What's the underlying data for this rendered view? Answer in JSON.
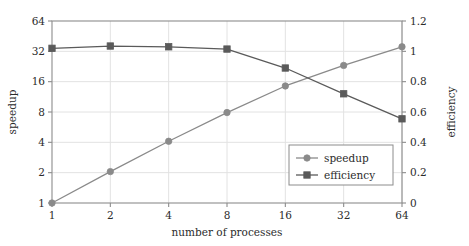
{
  "chart_data": {
    "type": "line",
    "title": "",
    "xlabel": "number of processes",
    "ylabel": "speedup",
    "y2label": "efficiency",
    "x": [
      1,
      2,
      4,
      8,
      16,
      32,
      64
    ],
    "xscale": "log2",
    "xtick_labels": [
      "1",
      "2",
      "4",
      "8",
      "16",
      "32",
      "64"
    ],
    "xlim": [
      1,
      64
    ],
    "yscale": "log2",
    "ytick_labels": [
      "1",
      "2",
      "4",
      "8",
      "16",
      "32",
      "64"
    ],
    "ytick_values": [
      1,
      2,
      4,
      8,
      16,
      32,
      64
    ],
    "ylim": [
      1,
      64
    ],
    "y2tick_labels": [
      "0",
      "0.2",
      "0.4",
      "0.6",
      "0.8",
      "1",
      "1.2"
    ],
    "y2tick_values": [
      0,
      0.2,
      0.4,
      0.6,
      0.8,
      1,
      1.2
    ],
    "y2lim": [
      0,
      1.2
    ],
    "grid": true,
    "legend_position": "lower right",
    "series": [
      {
        "name": "speedup",
        "axis": "left",
        "marker": "circle",
        "color": "#8a8a8a",
        "values": [
          1,
          2.05,
          4.1,
          7.9,
          14.5,
          23.2,
          35.5
        ]
      },
      {
        "name": "efficiency",
        "axis": "right",
        "marker": "square",
        "color": "#5a5a5a",
        "values": [
          1.02,
          1.035,
          1.03,
          1.015,
          0.89,
          0.72,
          0.555
        ]
      }
    ],
    "legend_entries": [
      {
        "label": "speedup",
        "marker": "circle"
      },
      {
        "label": "efficiency",
        "marker": "square"
      }
    ]
  },
  "colors": {
    "speedup": "#8a8a8a",
    "efficiency": "#5a5a5a",
    "axis": "#8c8c8c",
    "grid": "#e2e2e2",
    "text": "#2b2b2b",
    "background": "#ffffff"
  }
}
